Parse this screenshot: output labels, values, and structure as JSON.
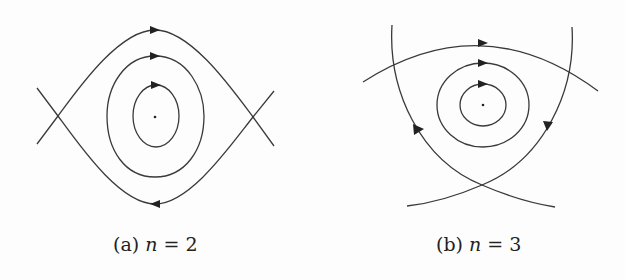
{
  "figure": {
    "panels": [
      {
        "id": "a",
        "label": "(a)",
        "variable": "n",
        "equals": "=",
        "value": "2",
        "description": "Phase portrait with center and two saddle points; nested closed orbits and separatrices"
      },
      {
        "id": "b",
        "label": "(b)",
        "variable": "n",
        "equals": "=",
        "value": "3",
        "description": "Phase portrait with center and three saddle points forming a curved triangle; nested closed orbits"
      }
    ],
    "colors": {
      "line": "#3a3a3a",
      "arrow": "#222222",
      "background": "#fdfdfd"
    }
  }
}
